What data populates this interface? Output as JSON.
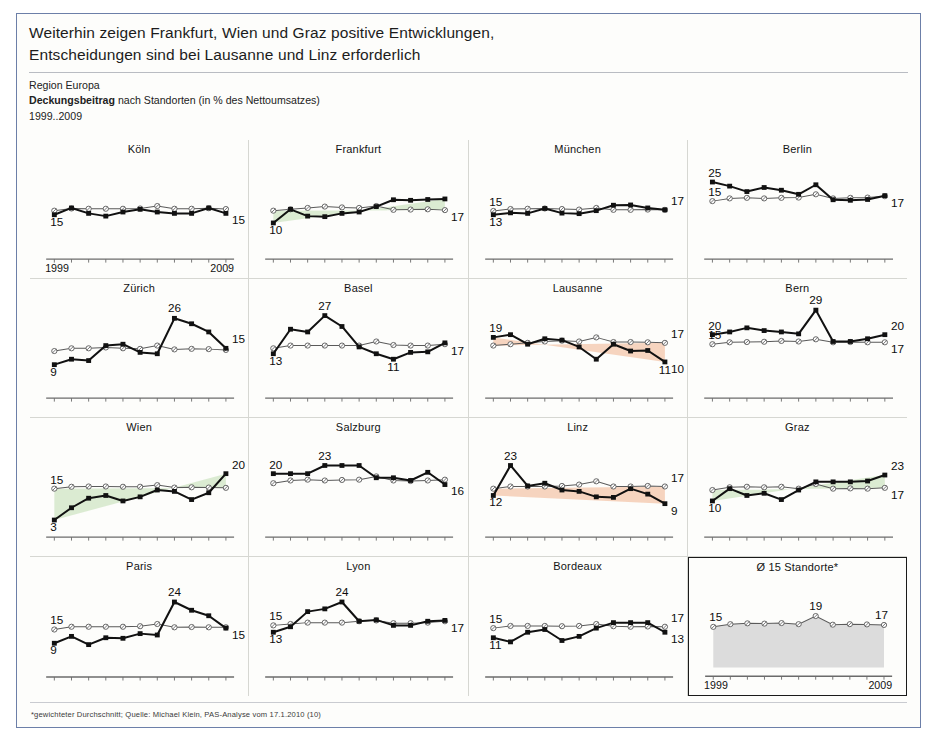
{
  "header": {
    "title_line1": "Weiterhin zeigen Frankfurt, Wien und Graz positive Entwicklungen,",
    "title_line2": "Entscheidungen sind bei Lausanne und Linz erforderlich",
    "region": "Region Europa",
    "metric_bold": "Deckungsbeitrag",
    "metric_rest": " nach Standorten (in % des Nettoumsatzes)",
    "period": "1999..2009"
  },
  "footnote": "*gewichteter Durchschnitt; Quelle: Michael Klein, PAS-Analyse vom 17.1.2010 (10)",
  "axis": {
    "start_year": "1999",
    "end_year": "2009"
  },
  "colors": {
    "actual_line": "#111111",
    "reference_line": "#5a5a5a",
    "positive_fill": "#d9ead0",
    "negative_fill": "#f6d2bc",
    "average_fill": "#dcdcdc",
    "panel_border": "#d6d7d2",
    "slide_border": "#6c7fa8"
  },
  "legend": {
    "actual_name": "Deckungsbeitrag Standort",
    "reference_name": "Durchschnitt 15 Standorte"
  },
  "chart_data": {
    "type": "line",
    "title": "Deckungsbeitrag nach Standorten (in % des Nettoumsatzes)",
    "subtitle": "Region Europa",
    "xlabel": "",
    "ylabel": "Deckungsbeitrag (% des Nettoumsatzes)",
    "x": [
      1999,
      2000,
      2001,
      2002,
      2003,
      2004,
      2005,
      2006,
      2007,
      2008,
      2009
    ],
    "ylim": [
      0,
      30
    ],
    "grid": false,
    "legend_position": "none",
    "panels": [
      {
        "name": "Köln",
        "trend": "neutral",
        "labels": {
          "left_actual": "15",
          "left_reference": "",
          "right_actual": "15",
          "right_reference": "",
          "peak": ""
        },
        "series": [
          {
            "name": "actual",
            "values": [
              13,
              15.5,
              13.5,
              12.5,
              14,
              15,
              14,
              13.5,
              13.5,
              15.5,
              13.5
            ]
          },
          {
            "name": "reference",
            "values": [
              14.5,
              15.3,
              15.2,
              15.2,
              15.2,
              15.3,
              16.2,
              15.2,
              15.2,
              15.4,
              15.1
            ]
          }
        ]
      },
      {
        "name": "Frankfurt",
        "trend": "positive",
        "labels": {
          "left_actual": "10",
          "left_reference": "",
          "right_actual": "",
          "right_reference": "17",
          "peak": ""
        },
        "series": [
          {
            "name": "actual",
            "values": [
              10,
              15,
              12.5,
              12.3,
              13.5,
              14,
              16,
              18.5,
              18.3,
              18.6,
              18.8
            ]
          },
          {
            "name": "reference",
            "values": [
              14.5,
              15,
              15.5,
              16,
              15.7,
              15.5,
              16.2,
              14.8,
              14.9,
              15,
              14.7
            ]
          }
        ]
      },
      {
        "name": "München",
        "trend": "neutral",
        "labels": {
          "left_actual": "13",
          "left_reference": "15",
          "right_actual": "",
          "right_reference": "17",
          "peak": ""
        },
        "series": [
          {
            "name": "actual",
            "values": [
              13,
              13.7,
              13.5,
              15.3,
              13.6,
              13.4,
              14.5,
              16.5,
              16.6,
              15.5,
              14.8
            ]
          },
          {
            "name": "reference",
            "values": [
              14.4,
              15.1,
              15.2,
              15.3,
              15.1,
              14.9,
              15.5,
              14.8,
              14.8,
              14.9,
              14.8
            ]
          }
        ]
      },
      {
        "name": "Berlin",
        "trend": "neutral",
        "labels": {
          "left_actual": "25",
          "left_reference": "15",
          "right_actual": "",
          "right_reference": "17",
          "peak": ""
        },
        "series": [
          {
            "name": "actual",
            "values": [
              25,
              23.5,
              21.5,
              23,
              22,
              20.5,
              24,
              18.5,
              18.3,
              18.6,
              20
            ]
          },
          {
            "name": "reference",
            "values": [
              18,
              19,
              19.2,
              19,
              19.2,
              19.3,
              20.5,
              19,
              19.2,
              19.3,
              19.8
            ]
          }
        ]
      },
      {
        "name": "Zürich",
        "trend": "neutral",
        "labels": {
          "left_actual": "9",
          "left_reference": "",
          "right_actual": "15",
          "right_reference": "",
          "peak": "26"
        },
        "series": [
          {
            "name": "actual",
            "values": [
              9,
              11,
              10.5,
              16,
              16.5,
              13.5,
              13,
              26,
              24,
              21,
              15
            ]
          },
          {
            "name": "reference",
            "values": [
              14,
              15,
              15,
              15.3,
              15,
              14.8,
              16,
              14.6,
              14.8,
              14.7,
              14.4
            ]
          }
        ]
      },
      {
        "name": "Basel",
        "trend": "neutral",
        "labels": {
          "left_actual": "13",
          "left_reference": "",
          "right_actual": "",
          "right_reference": "17",
          "peak": "27",
          "low": "11"
        },
        "series": [
          {
            "name": "actual",
            "values": [
              13,
              22,
              21,
              27,
              23,
              15.5,
              13,
              11,
              13.5,
              13.7,
              17
            ]
          },
          {
            "name": "reference",
            "values": [
              15,
              16,
              16,
              16,
              16,
              16,
              17.5,
              16.2,
              16,
              16,
              16.5
            ]
          }
        ]
      },
      {
        "name": "Lausanne",
        "trend": "negative",
        "labels": {
          "left_actual": "19",
          "left_reference": "",
          "right_actual": "10",
          "right_reference": "17",
          "low": "11"
        },
        "series": [
          {
            "name": "actual",
            "values": [
              19,
              20,
              16.5,
              18.5,
              18,
              15.5,
              11,
              16.5,
              14,
              14.2,
              10
            ]
          },
          {
            "name": "reference",
            "values": [
              16,
              16.5,
              17,
              17.5,
              17.8,
              17.5,
              19,
              17.3,
              17.3,
              17.2,
              17
            ]
          }
        ]
      },
      {
        "name": "Bern",
        "trend": "neutral",
        "labels": {
          "left_actual": "20",
          "left_reference": "15",
          "right_actual": "20",
          "right_reference": "17",
          "peak": "29"
        },
        "series": [
          {
            "name": "actual",
            "values": [
              20,
              21,
              22.5,
              21.5,
              21,
              20.3,
              29,
              17.5,
              17.5,
              18.5,
              20
            ]
          },
          {
            "name": "reference",
            "values": [
              16.5,
              17.2,
              17.3,
              17.4,
              17.7,
              17.5,
              18.3,
              17.2,
              17.3,
              17.2,
              17.2
            ]
          }
        ]
      },
      {
        "name": "Wien",
        "trend": "positive",
        "labels": {
          "left_actual": "3",
          "left_reference": "15",
          "right_actual": "20",
          "right_reference": "",
          "peak": ""
        },
        "series": [
          {
            "name": "actual",
            "values": [
              3,
              7.5,
              11,
              12,
              10,
              11.5,
              14,
              13.5,
              10.5,
              13,
              20
            ]
          },
          {
            "name": "reference",
            "values": [
              14.5,
              15.2,
              15.3,
              15.3,
              15.2,
              15.2,
              15.8,
              14.9,
              15,
              14.9,
              14.8
            ]
          }
        ]
      },
      {
        "name": "Salzburg",
        "trend": "neutral",
        "labels": {
          "left_actual": "20",
          "left_reference": "",
          "right_actual": "16",
          "right_reference": "",
          "peak": "23"
        },
        "series": [
          {
            "name": "actual",
            "values": [
              20,
              20,
              20,
              23,
              23,
              23,
              18.5,
              18.5,
              17.5,
              20.5,
              16
            ]
          },
          {
            "name": "reference",
            "values": [
              16.5,
              17.5,
              17.8,
              17.5,
              17.7,
              17.8,
              19,
              17.5,
              17.3,
              17.5,
              17.8
            ]
          }
        ]
      },
      {
        "name": "Linz",
        "trend": "negative",
        "labels": {
          "left_actual": "12",
          "left_reference": "",
          "right_actual": "9",
          "right_reference": "17",
          "peak": "23"
        },
        "series": [
          {
            "name": "actual",
            "values": [
              12,
              23,
              15.5,
              16.5,
              14,
              13.5,
              11.5,
              11.3,
              14.5,
              12.5,
              9
            ]
          },
          {
            "name": "reference",
            "values": [
              14.5,
              15.3,
              15.3,
              15.3,
              15.5,
              16,
              17.2,
              15.3,
              15.3,
              15.5,
              15.3
            ]
          }
        ]
      },
      {
        "name": "Graz",
        "trend": "positive",
        "labels": {
          "left_actual": "10",
          "left_reference": "",
          "right_actual": "23",
          "right_reference": "17",
          "peak": ""
        },
        "series": [
          {
            "name": "actual",
            "values": [
              10,
              14.5,
              12,
              12.8,
              10.5,
              14,
              17,
              17,
              17,
              17.3,
              19.5
            ]
          },
          {
            "name": "reference",
            "values": [
              14,
              15,
              15.2,
              15,
              15.2,
              14.5,
              16.2,
              14.5,
              14.6,
              14.5,
              14.8
            ]
          }
        ]
      },
      {
        "name": "Paris",
        "trend": "neutral",
        "labels": {
          "left_actual": "9",
          "left_reference": "15",
          "right_actual": "15",
          "right_reference": "",
          "peak": "24"
        },
        "series": [
          {
            "name": "actual",
            "values": [
              9,
              11.5,
              8.5,
              11,
              10.8,
              12.5,
              12,
              24,
              21,
              19,
              14.5
            ]
          },
          {
            "name": "reference",
            "values": [
              14,
              15,
              15,
              15,
              15,
              15.2,
              16,
              14.8,
              14.9,
              14.8,
              14.8
            ]
          }
        ]
      },
      {
        "name": "Lyon",
        "trend": "neutral",
        "labels": {
          "left_actual": "13",
          "left_reference": "15",
          "right_actual": "",
          "right_reference": "17",
          "peak": "24"
        },
        "series": [
          {
            "name": "actual",
            "values": [
              13,
              15,
              20.5,
              21.5,
              24,
              17,
              17.5,
              15.5,
              15.5,
              17,
              17.3
            ]
          },
          {
            "name": "reference",
            "values": [
              15.5,
              16,
              16.5,
              16.5,
              16.5,
              17,
              17.3,
              16.3,
              16.3,
              16.5,
              17
            ]
          }
        ]
      },
      {
        "name": "Bordeaux",
        "trend": "neutral",
        "labels": {
          "left_actual": "11",
          "left_reference": "15",
          "right_actual": "13",
          "right_reference": "17",
          "peak": ""
        },
        "series": [
          {
            "name": "actual",
            "values": [
              11,
              9.5,
              13,
              14,
              10,
              11.5,
              14.5,
              16.5,
              16.5,
              16.5,
              13
            ]
          },
          {
            "name": "reference",
            "values": [
              14.5,
              15.3,
              15.3,
              15.3,
              15.2,
              15.3,
              16,
              15.2,
              15,
              15.1,
              15
            ]
          }
        ]
      },
      {
        "name": "Ø 15 Standorte*",
        "trend": "average",
        "labels": {
          "left_reference": "15",
          "right_reference": "17",
          "peak": "19"
        },
        "series": [
          {
            "name": "reference",
            "values": [
              15,
              16,
              16.3,
              16.2,
              16.4,
              16,
              19,
              15.8,
              16,
              15.9,
              15.7
            ]
          }
        ]
      }
    ]
  }
}
